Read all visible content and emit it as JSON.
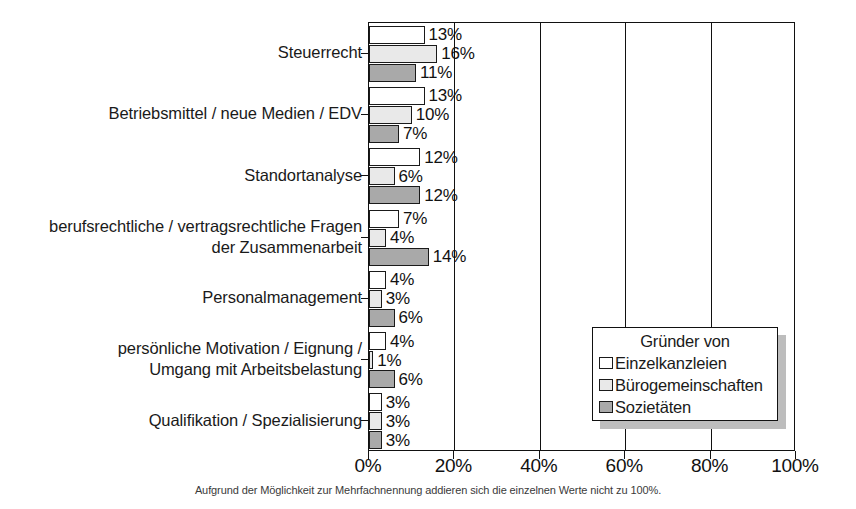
{
  "chart_data": {
    "type": "bar",
    "orientation": "horizontal",
    "title": "",
    "xlabel": "",
    "ylabel": "",
    "xlim": [
      0,
      100
    ],
    "xticks": [
      "0%",
      "20%",
      "40%",
      "60%",
      "80%",
      "100%"
    ],
    "xtick_values": [
      0,
      20,
      40,
      60,
      80,
      100
    ],
    "grid": "vertical",
    "legend_position": "center-right",
    "legend_title": "Gründer von",
    "categories": [
      "Steuerrecht",
      "Betriebsmittel / neue Medien / EDV",
      "Standortanalyse",
      "berufsrechtliche / vertragsrechtliche Fragen\nder Zusammenarbeit",
      "Personalmanagement",
      "persönliche Motivation / Eignung /\nUmgang mit Arbeitsbelastung",
      "Qualifikation / Spezialisierung"
    ],
    "series": [
      {
        "name": "Einzelkanzleien",
        "color": "#ffffff",
        "values": [
          13,
          13,
          12,
          7,
          4,
          4,
          3
        ],
        "labels": [
          "13%",
          "13%",
          "12%",
          "7%",
          "4%",
          "4%",
          "3%"
        ]
      },
      {
        "name": "Bürogemeinschaften",
        "color": "#e9e9e9",
        "values": [
          16,
          10,
          6,
          4,
          3,
          1,
          3
        ],
        "labels": [
          "16%",
          "10%",
          "6%",
          "4%",
          "3%",
          "1%",
          "3%"
        ]
      },
      {
        "name": "Sozietäten",
        "color": "#a9a9a9",
        "values": [
          11,
          7,
          12,
          14,
          6,
          6,
          3
        ],
        "labels": [
          "11%",
          "7%",
          "12%",
          "14%",
          "6%",
          "6%",
          "3%"
        ]
      }
    ],
    "footnote": "Aufgrund der Möglichkeit zur Mehrfachnennung addieren sich die einzelnen Werte nicht zu 100%."
  },
  "colors": {
    "series_einzelkanzleien": "#ffffff",
    "series_buerogemeinschaften": "#e9e9e9",
    "series_sozietaeten": "#a9a9a9",
    "axis": "#111111",
    "text": "#1a1a1a",
    "legend_shadow": "#bdbdbd",
    "background": "#ffffff"
  }
}
